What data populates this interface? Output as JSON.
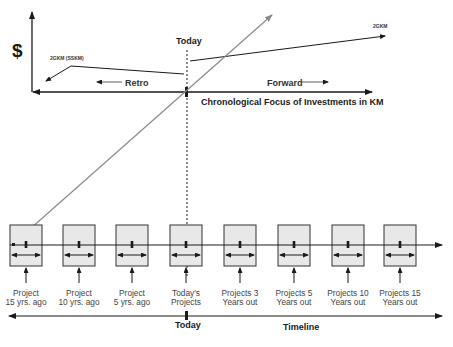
{
  "top_chart": {
    "y_axis_label": "$",
    "today_label": "Today",
    "left_series_label": "2GKM (SSKM)",
    "right_series_label": "2GKM",
    "retro_label": "Retro",
    "forward_label": "Forward",
    "x_axis_title": "Chronological Focus of Investments in KM"
  },
  "projects": [
    {
      "line1": "Project",
      "line2": "15 yrs. ago"
    },
    {
      "line1": "Project",
      "line2": "10 yrs. ago"
    },
    {
      "line1": "Project",
      "line2": "5 yrs. ago"
    },
    {
      "line1": "Today's",
      "line2": "Projects"
    },
    {
      "line1": "Projects 3",
      "line2": "Years out"
    },
    {
      "line1": "Projects 5",
      "line2": "Years out"
    },
    {
      "line1": "Projects 10",
      "line2": "Years out"
    },
    {
      "line1": "Projects 15",
      "line2": "Years out"
    }
  ],
  "timeline": {
    "today_label": "Today",
    "title": "Timeline"
  },
  "colors": {
    "line": "#1a1a1a",
    "diagonal": "#8a8a8a",
    "box_fill": "#e8e8e8"
  }
}
